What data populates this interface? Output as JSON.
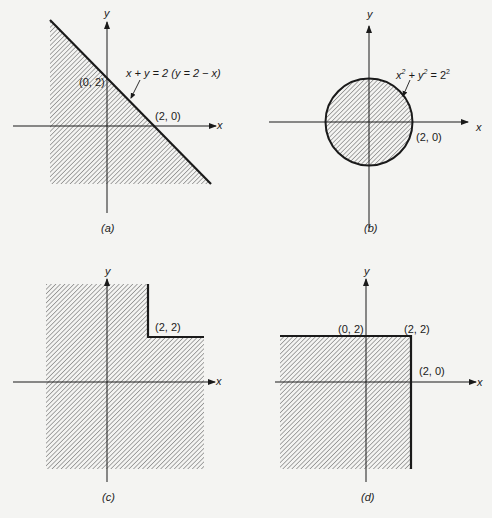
{
  "figures": [
    {
      "id": "a",
      "caption": "(a)",
      "axis_x": "x",
      "axis_y": "y",
      "labels": {
        "intercept_y": "(0, 2)",
        "intercept_x": "(2, 0)",
        "equation": "x + y = 2   (y = 2 − x)"
      },
      "region": "x + y ≤ 2 (below line)"
    },
    {
      "id": "b",
      "caption": "(b)",
      "axis_x": "x",
      "axis_y": "y",
      "labels": {
        "point": "(2, 0)",
        "equation_base": "x",
        "equation_sq1": "2",
        "equation_mid": " + y",
        "equation_sq2": "2",
        "equation_eq": " = 2",
        "equation_sq3": "2"
      },
      "region": "x² + y² ≤ 2²"
    },
    {
      "id": "c",
      "caption": "(c)",
      "axis_x": "x",
      "axis_y": "y",
      "labels": {
        "corner": "(2, 2)"
      },
      "region": "not (x > 2 and y > 2)"
    },
    {
      "id": "d",
      "caption": "(d)",
      "axis_x": "x",
      "axis_y": "y",
      "labels": {
        "p1": "(0, 2)",
        "p2": "(2, 2)",
        "p3": "(2, 0)"
      },
      "region": "x ≤ 2 and y ≤ 2"
    }
  ],
  "colors": {
    "ink": "#1a1a1a",
    "hatch": "#555555",
    "background": "#f4f4f2"
  }
}
